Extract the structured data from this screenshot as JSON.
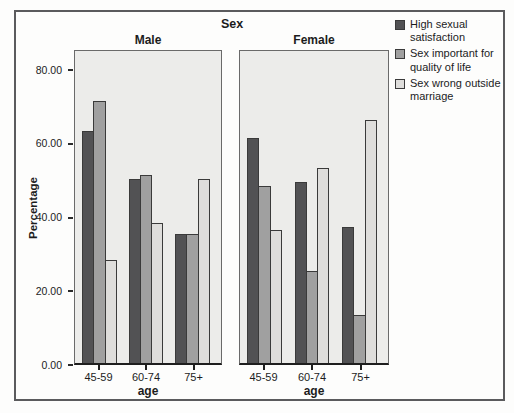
{
  "figure": {
    "title": "Sex",
    "colors": {
      "bar_dark": "#525254",
      "bar_medium": "#a0a0a0",
      "bar_light": "#dedddb",
      "panel_background": "#ececea",
      "frame_border": "#5b5b5d",
      "axis_line": "#1e1e1e",
      "text": "#1c1c1c"
    }
  },
  "chart_data": {
    "type": "bar",
    "title": "Sex",
    "xlabel": "age",
    "ylabel": "Percentage",
    "ylim": [
      0,
      80
    ],
    "grid": false,
    "legend_position": "top-right",
    "y_ticks": [
      {
        "value": 80,
        "label": "80.00"
      },
      {
        "value": 60,
        "label": "60.00"
      },
      {
        "value": 40,
        "label": "40.00"
      },
      {
        "value": 20,
        "label": "20.00"
      },
      {
        "value": 0,
        "label": "0.00"
      }
    ],
    "categories": [
      "45-59",
      "60-74",
      "75+"
    ],
    "panels": [
      {
        "name": "Male",
        "series": [
          {
            "name": "High sexual satisfaction",
            "color": "#525254",
            "values": [
              63,
              50,
              35
            ]
          },
          {
            "name": "Sex important for quality of life",
            "color": "#a0a0a0",
            "values": [
              71,
              51,
              35
            ]
          },
          {
            "name": "Sex wrong outside marriage",
            "color": "#dedddb",
            "values": [
              28,
              38,
              50
            ]
          }
        ]
      },
      {
        "name": "Female",
        "series": [
          {
            "name": "High sexual satisfaction",
            "color": "#525254",
            "values": [
              61,
              49,
              37
            ]
          },
          {
            "name": "Sex important for quality of life",
            "color": "#a0a0a0",
            "values": [
              48,
              25,
              13
            ]
          },
          {
            "name": "Sex wrong outside marriage",
            "color": "#dedddb",
            "values": [
              36,
              53,
              66
            ]
          }
        ]
      }
    ]
  }
}
